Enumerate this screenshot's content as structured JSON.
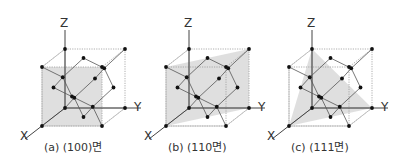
{
  "figure": {
    "panels": [
      {
        "id": "a",
        "caption": "(a) (100)면",
        "offset_x": 0,
        "plane": "100",
        "axis_labels": {
          "z": "Z",
          "y": "Y",
          "x": "X"
        }
      },
      {
        "id": "b",
        "caption": "(b) (110면)",
        "offset_x": 124,
        "plane": "110",
        "axis_labels": {
          "z": "Z",
          "y": "Y",
          "x": "X"
        }
      },
      {
        "id": "c",
        "caption": "(c) (111면)",
        "offset_x": 247,
        "plane": "111",
        "axis_labels": {
          "z": "Z",
          "y": "Y",
          "x": "X"
        }
      }
    ],
    "colors": {
      "plane_fill": "#d9d9d9",
      "edge": "#999999",
      "axis": "#444444",
      "atom": "#111111",
      "bond": "#555555"
    }
  }
}
